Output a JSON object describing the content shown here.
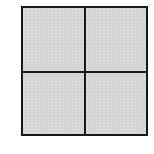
{
  "diagram": {
    "type": "grid",
    "rows": 2,
    "columns": 2,
    "cells": [
      {
        "row": 0,
        "col": 0,
        "label": ""
      },
      {
        "row": 0,
        "col": 1,
        "label": ""
      },
      {
        "row": 1,
        "col": 0,
        "label": ""
      },
      {
        "row": 1,
        "col": 1,
        "label": ""
      }
    ],
    "colors": {
      "fill": "#d6d6d6",
      "border": "#1a1a1a",
      "background": "#ffffff"
    }
  }
}
